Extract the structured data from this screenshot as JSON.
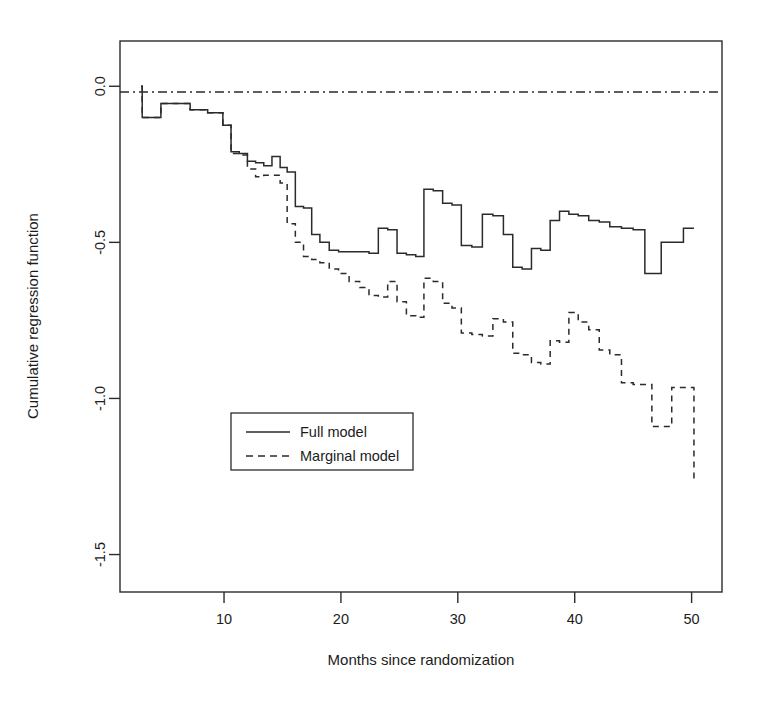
{
  "chart_data": {
    "type": "line",
    "subtype": "step",
    "title": "",
    "xlabel": "Months since randomization",
    "ylabel": "Cumulative regression function",
    "xlim": [
      1.1,
      52.6
    ],
    "ylim": [
      -1.62,
      0.145
    ],
    "xticks": [
      10,
      20,
      30,
      40,
      50
    ],
    "yticks": [
      0.0,
      -0.5,
      -1.0,
      -1.5
    ],
    "xtick_labels": [
      "10",
      "20",
      "30",
      "40",
      "50"
    ],
    "ytick_labels": [
      "0.0",
      "-0.5",
      "-1.0",
      "-1.5"
    ],
    "grid": false,
    "legend_position": "center-left",
    "reference_line": {
      "y": 0.0,
      "style": "dashdot",
      "color": "#2b2b2b"
    },
    "frame": true,
    "series": [
      {
        "name": "Full model",
        "style": "solid",
        "color": "#2b2b2b",
        "x": [
          2.9,
          3.0,
          4.0,
          4.6,
          6.2,
          7.1,
          7.9,
          8.6,
          9.2,
          9.9,
          10.6,
          11.3,
          12.0,
          12.7,
          13.4,
          14.1,
          14.8,
          15.4,
          16.1,
          16.8,
          17.5,
          18.2,
          19.0,
          19.8,
          20.7,
          21.6,
          22.4,
          23.2,
          24.0,
          24.8,
          25.6,
          26.4,
          27.1,
          27.9,
          28.7,
          29.5,
          30.3,
          31.2,
          32.1,
          33.0,
          33.9,
          34.7,
          35.5,
          36.3,
          37.1,
          37.9,
          38.7,
          39.5,
          40.3,
          41.2,
          42.1,
          43.0,
          44.0,
          45.0,
          46.0,
          46.6,
          47.4,
          48.3,
          49.3,
          50.2
        ],
        "y": [
          0.0,
          -0.1,
          -0.1,
          -0.055,
          -0.055,
          -0.075,
          -0.075,
          -0.085,
          -0.085,
          -0.125,
          -0.21,
          -0.215,
          -0.24,
          -0.245,
          -0.255,
          -0.225,
          -0.26,
          -0.275,
          -0.385,
          -0.39,
          -0.475,
          -0.5,
          -0.525,
          -0.53,
          -0.53,
          -0.53,
          -0.535,
          -0.455,
          -0.46,
          -0.535,
          -0.54,
          -0.545,
          -0.33,
          -0.335,
          -0.375,
          -0.38,
          -0.51,
          -0.515,
          -0.41,
          -0.415,
          -0.475,
          -0.58,
          -0.585,
          -0.52,
          -0.525,
          -0.43,
          -0.4,
          -0.41,
          -0.415,
          -0.43,
          -0.435,
          -0.45,
          -0.455,
          -0.46,
          -0.6,
          -0.6,
          -0.5,
          -0.5,
          -0.455,
          -0.455
        ]
      },
      {
        "name": "Marginal model",
        "style": "dashed",
        "color": "#2b2b2b",
        "x": [
          2.9,
          3.0,
          4.0,
          4.6,
          6.2,
          7.1,
          7.9,
          8.6,
          9.2,
          9.9,
          10.6,
          11.3,
          12.0,
          12.7,
          13.4,
          14.1,
          14.8,
          15.4,
          16.1,
          16.8,
          17.5,
          18.2,
          19.0,
          19.8,
          20.7,
          21.6,
          22.4,
          23.2,
          24.0,
          24.8,
          25.6,
          26.4,
          27.1,
          27.9,
          28.7,
          29.5,
          30.3,
          31.2,
          32.1,
          33.0,
          33.9,
          34.7,
          35.5,
          36.3,
          37.1,
          37.9,
          38.7,
          39.5,
          40.3,
          41.2,
          42.1,
          43.0,
          44.0,
          45.0,
          46.0,
          46.6,
          47.4,
          48.3,
          49.3,
          50.2
        ],
        "y": [
          0.0,
          -0.1,
          -0.1,
          -0.055,
          -0.055,
          -0.075,
          -0.075,
          -0.085,
          -0.085,
          -0.125,
          -0.215,
          -0.22,
          -0.265,
          -0.29,
          -0.285,
          -0.285,
          -0.31,
          -0.44,
          -0.5,
          -0.545,
          -0.555,
          -0.565,
          -0.585,
          -0.6,
          -0.625,
          -0.645,
          -0.67,
          -0.675,
          -0.625,
          -0.69,
          -0.735,
          -0.74,
          -0.615,
          -0.625,
          -0.695,
          -0.71,
          -0.79,
          -0.795,
          -0.8,
          -0.745,
          -0.755,
          -0.855,
          -0.86,
          -0.885,
          -0.89,
          -0.815,
          -0.82,
          -0.725,
          -0.755,
          -0.78,
          -0.845,
          -0.86,
          -0.95,
          -0.955,
          -0.955,
          -1.09,
          -1.09,
          -0.965,
          -0.965,
          -1.265
        ]
      }
    ]
  },
  "legend": {
    "items": [
      {
        "label": "Full model",
        "style": "solid"
      },
      {
        "label": "Marginal model",
        "style": "dashed"
      }
    ]
  }
}
